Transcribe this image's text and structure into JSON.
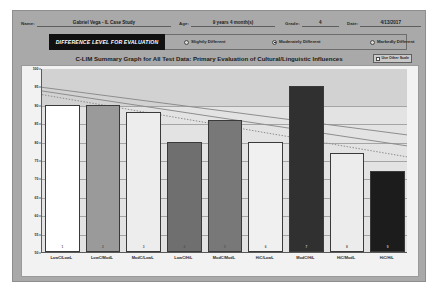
{
  "form": {
    "fields": [
      {
        "label": "Name:",
        "value": "Gabriel Vega - IL Case Study"
      },
      {
        "label": "Age:",
        "value": "9 years 4 month(s)"
      },
      {
        "label": "Grade:",
        "value": "4"
      },
      {
        "label": "Date:",
        "value": "4/13/2017"
      }
    ]
  },
  "difference_level": {
    "banner": "DIFFERENCE LEVEL FOR EVALUATION",
    "options": [
      {
        "label": "Slightly Different",
        "selected": false
      },
      {
        "label": "Moderately Different",
        "selected": true
      },
      {
        "label": "Markedly Different",
        "selected": false
      }
    ]
  },
  "scale_toggle": {
    "label": "Use Other Scale",
    "checked": false
  },
  "chart_data": {
    "type": "bar",
    "title": "C-LIM Summary Graph for All Test Data: Primary Evaluation of Cultural/Linguistic Influences",
    "xlabel": "",
    "ylabel": "",
    "ylim": [
      50,
      100
    ],
    "ytick_step": 5,
    "yticks": [
      100,
      95,
      90,
      85,
      80,
      75,
      70,
      65,
      60,
      55,
      50
    ],
    "grid": true,
    "legend": "none",
    "categories": [
      "LowC/LowL",
      "LowC/ModL",
      "ModC/LowL",
      "LowC/HiL",
      "ModC/ModL",
      "HiC/LowL",
      "ModC/HiL",
      "HiC/ModL",
      "HiC/HiL"
    ],
    "values": [
      90,
      90,
      88,
      80,
      86,
      80,
      95,
      77,
      72
    ],
    "point_labels": [
      "1",
      "2",
      "3",
      "4",
      "5",
      "6",
      "7",
      "8",
      "9"
    ],
    "bar_colors": [
      "#ffffff",
      "#9a9a9a",
      "#ededed",
      "#6f6f6f",
      "#787878",
      "#f0f0f0",
      "#303030",
      "#ececec",
      "#1c1c1c"
    ],
    "annotations": {
      "upper_band": {
        "from": 90,
        "to": 100,
        "color": "#d2d2d2"
      },
      "trend_lines": [
        {
          "name": "expected-upper",
          "y_start": 95,
          "y_end": 82,
          "style": "solid"
        },
        {
          "name": "expected-middle",
          "y_start": 94,
          "y_end": 79,
          "style": "solid"
        },
        {
          "name": "expected-lower",
          "y_start": 93,
          "y_end": 76,
          "style": "dotted"
        }
      ]
    }
  }
}
